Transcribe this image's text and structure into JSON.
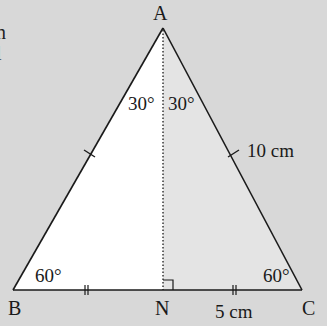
{
  "cropped_text_fragments": [
    "n",
    "l"
  ],
  "diagram": {
    "type": "equilateral triangle with altitude",
    "vertices": {
      "A": {
        "label": "A"
      },
      "B": {
        "label": "B"
      },
      "C": {
        "label": "C"
      },
      "N": {
        "label": "N"
      }
    },
    "angles": {
      "B": "60°",
      "C": "60°",
      "A_left": "30°",
      "A_right": "30°"
    },
    "lengths": {
      "AC": "10 cm",
      "NC": "5 cm"
    },
    "marks": {
      "AB_AC_equal_ticks": "single",
      "BN_NC_equal_ticks": "double",
      "right_angle_at": "N"
    }
  },
  "colors": {
    "background": "#d8d8d8",
    "left_half_fill": "#ffffff",
    "right_half_fill": "#e4e4e4",
    "stroke": "#1a1a1a"
  }
}
